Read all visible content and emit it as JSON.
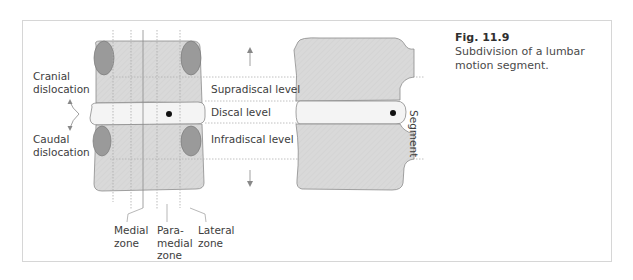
{
  "figure": {
    "number": "Fig. 11.9",
    "caption": "Subdivision of a lumbar motion segment."
  },
  "labels": {
    "cranial_line1": "Cranial",
    "cranial_line2": "dislocation",
    "caudal_line1": "Caudal",
    "caudal_line2": "dislocation",
    "supradiscal": "Supradiscal level",
    "discal": "Discal level",
    "infradiscal": "Infradiscal level",
    "segment": "Segment",
    "medial_line1": "Medial",
    "medial_line2": "zone",
    "paramedial_line1": "Para-",
    "paramedial_line2": "medial",
    "paramedial_line3": "zone",
    "lateral_line1": "Lateral",
    "lateral_line2": "zone"
  },
  "colors": {
    "bone": "#d9d9d9",
    "disc": "#f4f4f4",
    "facet": "#9a9a9a",
    "outline": "#8c8c8c",
    "dotted": "#b0b0b0",
    "frame": "#d6d6d6"
  }
}
